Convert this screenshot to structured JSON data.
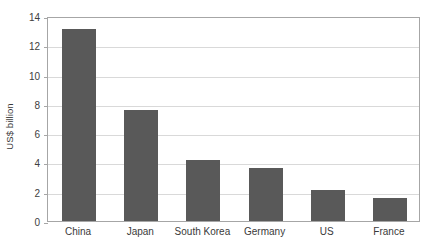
{
  "chart_data": {
    "type": "bar",
    "title": "",
    "subtitle": "",
    "xlabel": "",
    "ylabel": "US$ billion",
    "categories": [
      "China",
      "Japan",
      "South Korea",
      "Germany",
      "US",
      "France"
    ],
    "values": [
      13.1,
      7.6,
      4.2,
      3.6,
      2.1,
      1.6
    ],
    "series": [
      {
        "name": "US$ billion",
        "values": [
          13.1,
          7.6,
          4.2,
          3.6,
          2.1,
          1.6
        ],
        "color": "#595959"
      }
    ],
    "ylim": [
      0,
      14
    ],
    "ytick_step": 2,
    "ytick_labels": [
      "0",
      "2",
      "4",
      "6",
      "8",
      "10",
      "12",
      "14"
    ],
    "ytick_values": [
      0,
      2,
      4,
      6,
      8,
      10,
      12,
      14
    ],
    "grid": "horizontal",
    "legend": "none",
    "bar_color": "#595959",
    "gridline_color": "#d9d9d9",
    "axis_color": "#a6a6a6",
    "plot_border": "full"
  }
}
